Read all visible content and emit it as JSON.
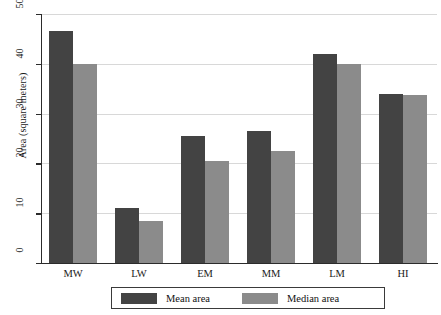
{
  "chart_data": {
    "type": "bar",
    "title": "",
    "subtitle": "",
    "xlabel": "",
    "ylabel": "Area (square meters)",
    "categories": [
      "MW",
      "LW",
      "EM",
      "MM",
      "LM",
      "HI"
    ],
    "series": [
      {
        "name": "Mean area",
        "color": "#434343",
        "values": [
          46.5,
          11.0,
          25.5,
          26.5,
          42.0,
          34.0
        ]
      },
      {
        "name": "Median area",
        "color": "#8b8b8b",
        "values": [
          40.0,
          8.5,
          20.5,
          22.5,
          40.0,
          33.7
        ]
      }
    ],
    "ylim": [
      0,
      50
    ],
    "yticks": [
      0,
      10,
      20,
      30,
      40,
      50
    ],
    "ytick_labels": [
      "0",
      "10",
      "20",
      "30",
      "40",
      "50"
    ],
    "grid": true,
    "grid_axis": "y",
    "legend_position": "below-axis",
    "bar_orientation": "vertical"
  },
  "legend": {
    "entries": [
      {
        "label": "Mean area",
        "swatch_color": "#434343"
      },
      {
        "label": "Median area",
        "swatch_color": "#8b8b8b"
      }
    ]
  },
  "axes": {
    "y_title": "Area (square meters)",
    "y_tick_labels": [
      "50",
      "40",
      "30",
      "20",
      "10",
      "0"
    ],
    "x_tick_labels": [
      "MW",
      "LW",
      "EM",
      "MM",
      "LM",
      "HI"
    ]
  },
  "colors": {
    "mean_bar": "#434343",
    "median_bar": "#8b8b8b",
    "axis": "#2b2b2b",
    "gridline": "#d8d8d8",
    "background": "#ffffff"
  }
}
